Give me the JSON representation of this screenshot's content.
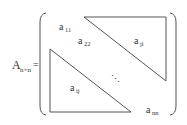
{
  "matrix": {
    "name": "A",
    "subscript": "n×n",
    "equals": "=",
    "entries": {
      "a11": {
        "base": "a",
        "sub": "11"
      },
      "a22": {
        "base": "a",
        "sub": "22"
      },
      "aji": {
        "base": "a",
        "sub": "ji"
      },
      "aij": {
        "base": "a",
        "sub": "ij"
      },
      "ann": {
        "base": "a",
        "sub": "nn"
      }
    },
    "dots": "⋱"
  },
  "colors": {
    "line": "#555555",
    "text": "#333333"
  }
}
